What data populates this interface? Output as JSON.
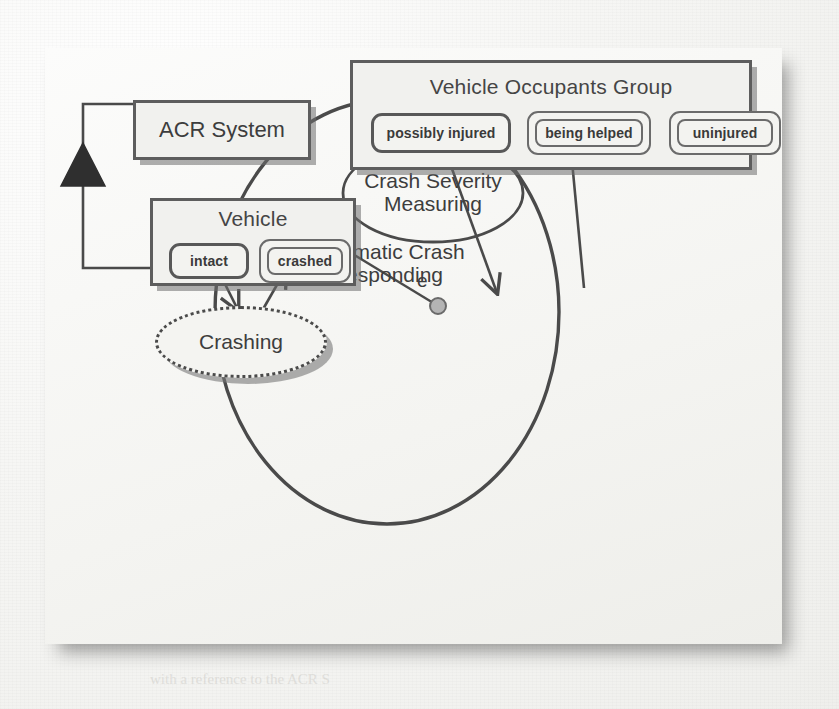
{
  "diagram": {
    "acr_system": {
      "label": "ACR System"
    },
    "vehicle": {
      "title": "Vehicle",
      "states": [
        {
          "id": "intact",
          "label": "intact",
          "style": "single"
        },
        {
          "id": "crashed",
          "label": "crashed",
          "style": "double"
        }
      ]
    },
    "vehicle_occupants_group": {
      "title": "Vehicle Occupants Group",
      "states": [
        {
          "id": "possibly-injured",
          "label": "possibly injured",
          "style": "double"
        },
        {
          "id": "being-helped",
          "label": "being helped",
          "style": "double"
        },
        {
          "id": "uninjured",
          "label": "uninjured",
          "style": "double"
        }
      ]
    },
    "crashing": {
      "label": "Crashing"
    },
    "automatic_crash_responding": {
      "label_line1": "Automatic Crash",
      "label_line2": "Responding"
    },
    "crash_severity_measuring": {
      "label_line1": "Crash Severity",
      "label_line2": "Measuring"
    },
    "event_port": {
      "label": "e"
    },
    "connectors": [
      {
        "id": "acr-vehicle-generalization",
        "kind": "filled-triangle-aggregation"
      },
      {
        "id": "intact-to-crashing",
        "kind": "open-arrow"
      },
      {
        "id": "crashing-to-crashed",
        "kind": "open-arrow"
      },
      {
        "id": "crashed-to-event-port",
        "kind": "plain-line"
      },
      {
        "id": "possibly-injured-to-csm",
        "kind": "open-arrow"
      },
      {
        "id": "csm-to-being-helped",
        "kind": "open-arrow"
      }
    ],
    "colors": {
      "stroke": "#4a4a4a",
      "box_border": "#5d5d5d",
      "panel_bg": "#f4f4f1",
      "shadow": "#8e8e8e",
      "text": "#3d3d3d"
    }
  },
  "background": {
    "ghost_lines": [
      "of the system to be developed",
      "such as  the  requirements",
      "a number of environmental",
      "be analysed in order to",
      "In Crash Severity Measuring",
      "the system then measures the",
      "ACR System shall notify",
      "with a reference to the ACR S"
    ]
  }
}
